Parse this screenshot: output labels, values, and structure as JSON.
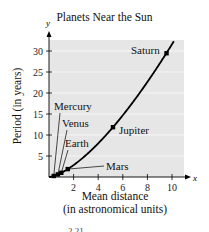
{
  "chart_data": {
    "type": "line",
    "title": "Planets Near the Sun",
    "xlabel": "Mean distance (in astronomical units)",
    "xlabel_lines": [
      "Mean distance",
      "(in astronomical units)"
    ],
    "ylabel": "Period (in years)",
    "x_axis_var": "x",
    "y_axis_var": "y",
    "xlim": [
      0,
      11.5
    ],
    "ylim": [
      0,
      32.5
    ],
    "xticks": [
      2,
      4,
      6,
      8,
      10
    ],
    "yticks": [
      5,
      10,
      15,
      20,
      25,
      30
    ],
    "grid": {
      "horizontal": true,
      "vertical": false
    },
    "background": "#e6e6e6",
    "curve": {
      "name": "Kepler curve y = x^1.5",
      "exponent": 1.5
    },
    "points": [
      {
        "label": "Mercury",
        "x": 0.387,
        "y": 0.241
      },
      {
        "label": "Venus",
        "x": 0.723,
        "y": 0.615
      },
      {
        "label": "Earth",
        "x": 1.0,
        "y": 1.0
      },
      {
        "label": "Mars",
        "x": 1.524,
        "y": 1.881
      },
      {
        "label": "Jupiter",
        "x": 5.203,
        "y": 11.86
      },
      {
        "label": "Saturn",
        "x": 9.555,
        "y": 29.46
      }
    ]
  },
  "figure_caption_partial": "2.21"
}
